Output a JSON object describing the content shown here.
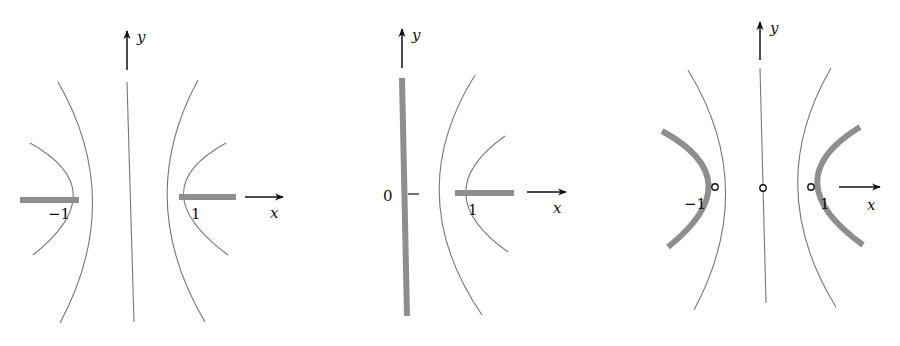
{
  "figure": {
    "colors": {
      "background": "#ffffff",
      "thin_curves": "#777777",
      "thick_segments": "#8e8e8e",
      "axes_and_text": "#111111"
    },
    "panels": [
      {
        "id": "left",
        "axis_labels": {
          "x": "x",
          "y": "y"
        },
        "tick_labels": {
          "neg_one": "−1",
          "one": "1"
        },
        "elements": "Vertical center line, two nested pairs of hyperbola branches, thick segments on x-axis to the left of −1 and to the right of 1"
      },
      {
        "id": "middle",
        "axis_labels": {
          "x": "x",
          "y": "y"
        },
        "tick_labels": {
          "zero": "0",
          "one": "1"
        },
        "elements": "Thick vertical segment along y-axis at x=0 with tick mark, two nested right hyperbola branches, thick segment on x-axis to the right of 1"
      },
      {
        "id": "right",
        "axis_labels": {
          "x": "x",
          "y": "y"
        },
        "tick_labels": {
          "neg_one": "−1",
          "one": "1"
        },
        "elements": "Vertical center line, thin hyperbola pair, thick hyperbola pair, open circles at −1, 0 and 1"
      }
    ]
  }
}
